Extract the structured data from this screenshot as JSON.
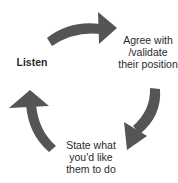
{
  "diagram": {
    "type": "cycle",
    "arrow_color": "#555555",
    "background": "#ffffff",
    "steps": [
      {
        "id": "listen",
        "label": "Listen"
      },
      {
        "id": "agree",
        "label": "Agree with /validate their position"
      },
      {
        "id": "state",
        "label": "State what you'd like them to do"
      }
    ],
    "arrows": [
      {
        "from": "listen",
        "to": "agree",
        "direction": "clockwise",
        "icon": "curved-arrow-right-icon"
      },
      {
        "from": "agree",
        "to": "state",
        "direction": "clockwise",
        "icon": "curved-arrow-down-icon"
      },
      {
        "from": "state",
        "to": "listen",
        "direction": "clockwise",
        "icon": "curved-arrow-up-icon"
      }
    ]
  }
}
